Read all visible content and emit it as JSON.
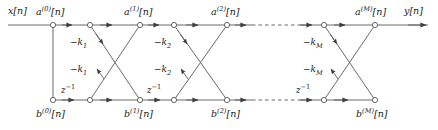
{
  "diagram": {
    "type": "signal-flow-graph",
    "stroke_color": "#4a4a4a",
    "text_color": "#1a1a1a",
    "node_fill": "#ffffff",
    "input_label": "x[n]",
    "output_label": "y[n]",
    "top_nodes": [
      {
        "id": "a0",
        "x": 53,
        "y": 25,
        "label": "a(0)[n]",
        "label_x": 36,
        "label_y": 8
      },
      {
        "id": "t1",
        "x": 90,
        "y": 25
      },
      {
        "id": "a1",
        "x": 140,
        "y": 25,
        "label": "a(1)[n]",
        "label_x": 124,
        "label_y": 8
      },
      {
        "id": "t2",
        "x": 174,
        "y": 25
      },
      {
        "id": "a2",
        "x": 227,
        "y": 25,
        "label": "a(2)[n]",
        "label_x": 211,
        "label_y": 8
      },
      {
        "id": "t3",
        "x": 324,
        "y": 25
      },
      {
        "id": "aM",
        "x": 375,
        "y": 25,
        "label": "a(M)[n]",
        "label_x": 356,
        "label_y": 8
      }
    ],
    "bottom_nodes": [
      {
        "id": "b0",
        "x": 53,
        "y": 100,
        "label": "b(0)[n]",
        "label_x": 36,
        "label_y": 110
      },
      {
        "id": "u1",
        "x": 90,
        "y": 100
      },
      {
        "id": "b1",
        "x": 140,
        "y": 100,
        "label": "b(1)[n]",
        "label_x": 124,
        "label_y": 110
      },
      {
        "id": "u2",
        "x": 174,
        "y": 100
      },
      {
        "id": "b2",
        "x": 227,
        "y": 100,
        "label": "b(2)[n]",
        "label_x": 211,
        "label_y": 110
      },
      {
        "id": "u3",
        "x": 324,
        "y": 100
      },
      {
        "id": "bM",
        "x": 375,
        "y": 100,
        "label": "b(M)[n]",
        "label_x": 357,
        "label_y": 110
      }
    ],
    "coefficient_labels": [
      {
        "text": "-k1",
        "x": 73,
        "y": 41,
        "stage": 1,
        "branch": "upper"
      },
      {
        "text": "-k1",
        "x": 73,
        "y": 68,
        "stage": 1,
        "branch": "lower"
      },
      {
        "text": "-k2",
        "x": 157,
        "y": 41,
        "stage": 2,
        "branch": "upper"
      },
      {
        "text": "-k2",
        "x": 157,
        "y": 68,
        "stage": 2,
        "branch": "lower"
      },
      {
        "text": "-kM",
        "x": 306,
        "y": 41,
        "stage": "M",
        "branch": "upper"
      },
      {
        "text": "-kM",
        "x": 306,
        "y": 68,
        "stage": "M",
        "branch": "lower"
      }
    ],
    "delay_labels": [
      {
        "text": "z-1",
        "x": 62,
        "y": 86
      },
      {
        "text": "z-1",
        "x": 148,
        "y": 86
      },
      {
        "text": "z-1",
        "x": 297,
        "y": 86
      }
    ],
    "io_labels": [
      {
        "text": "x[n]",
        "x": 8,
        "y": 8,
        "role": "input"
      },
      {
        "text": "y[n]",
        "x": 404,
        "y": 8,
        "role": "output"
      }
    ],
    "dashed_regions": [
      {
        "row": "top",
        "x1": 252,
        "x2": 300,
        "y": 25
      },
      {
        "row": "bottom",
        "x1": 252,
        "x2": 300,
        "y": 100
      }
    ]
  }
}
